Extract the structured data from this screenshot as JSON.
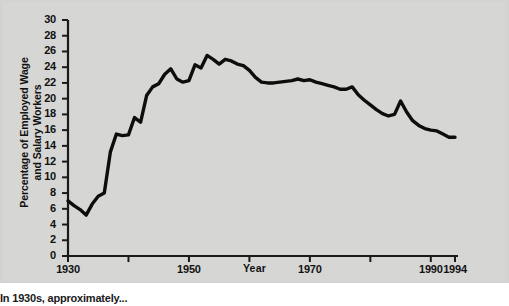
{
  "figure": {
    "background_color": "#d6d6d4",
    "line_color": "#0d0d0d",
    "axis_color": "#1a1a1a",
    "caption_fragment": "In 1930s, approximately..."
  },
  "chart_data": {
    "type": "line",
    "title": "",
    "subtitle": "",
    "xlabel": "Year",
    "ylabel": "Percentage of Employed Wage and Salary Workers",
    "ylabel_line1": "Percentage of Employed Wage",
    "ylabel_line2": "and Salary Workers",
    "xlim": [
      1930,
      1994
    ],
    "ylim": [
      0,
      30
    ],
    "grid": false,
    "legend": null,
    "legend_position": "none",
    "y_ticks": [
      0,
      2,
      4,
      6,
      8,
      10,
      12,
      14,
      16,
      18,
      20,
      22,
      24,
      26,
      28,
      30
    ],
    "y_tick_labels": [
      "0",
      "2",
      "4",
      "6",
      "8",
      "10",
      "12",
      "14",
      "16",
      "18",
      "20",
      "22",
      "24",
      "26",
      "28",
      "30"
    ],
    "x_major_ticks": [
      1930,
      1950,
      1970,
      1990,
      1994
    ],
    "x_major_tick_labels": [
      "1930",
      "1950",
      "1970",
      "1990",
      "1994"
    ],
    "x_minor_ticks": [
      1940,
      1960,
      1980
    ],
    "series": [
      {
        "name": "Union membership",
        "x": [
          1930,
          1931,
          1932,
          1933,
          1934,
          1935,
          1936,
          1937,
          1938,
          1939,
          1940,
          1941,
          1942,
          1943,
          1944,
          1945,
          1946,
          1947,
          1948,
          1949,
          1950,
          1951,
          1952,
          1953,
          1954,
          1955,
          1956,
          1957,
          1958,
          1959,
          1960,
          1961,
          1962,
          1963,
          1964,
          1965,
          1966,
          1967,
          1968,
          1969,
          1970,
          1971,
          1972,
          1973,
          1974,
          1975,
          1976,
          1977,
          1978,
          1979,
          1980,
          1981,
          1982,
          1983,
          1984,
          1985,
          1986,
          1987,
          1988,
          1989,
          1990,
          1991,
          1992,
          1993,
          1994
        ],
        "values": [
          7.0,
          6.4,
          5.9,
          5.2,
          6.6,
          7.6,
          8.0,
          13.2,
          15.5,
          15.3,
          15.4,
          17.6,
          17.0,
          20.4,
          21.5,
          21.9,
          23.1,
          23.8,
          22.5,
          22.1,
          22.3,
          24.3,
          23.9,
          25.5,
          25.0,
          24.4,
          25.0,
          24.8,
          24.4,
          24.2,
          23.6,
          22.7,
          22.1,
          22.0,
          22.0,
          22.1,
          22.2,
          22.3,
          22.5,
          22.3,
          22.4,
          22.1,
          21.9,
          21.7,
          21.5,
          21.2,
          21.2,
          21.5,
          20.5,
          19.8,
          19.2,
          18.6,
          18.1,
          17.8,
          18.0,
          19.7,
          18.3,
          17.2,
          16.6,
          16.2,
          16.0,
          15.9,
          15.5,
          15.1,
          15.1
        ]
      }
    ]
  }
}
